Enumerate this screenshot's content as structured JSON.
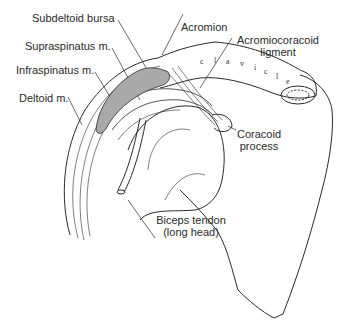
{
  "figure": {
    "labels": {
      "subdeltoid_bursa": "Subdeltoid bursa",
      "supraspinatus": "Supraspinatus m.",
      "infraspinatus": "Infraspinatus m.",
      "deltoid": "Deltoid m.",
      "acromion": "Acromion",
      "acromiocoracoid_line1": "Acromiocoracoid",
      "acromiocoracoid_line2": "ligment",
      "coracoid_line1": "Coracoid",
      "coracoid_line2": "process",
      "biceps_line1": "Biceps tendon",
      "biceps_line2": "(long head)",
      "clavicle_letters": [
        "c",
        "l",
        "a",
        "v",
        "i",
        "c",
        "l",
        "e"
      ]
    },
    "colors": {
      "ink": "#2a2a2a",
      "bursa_fill": "#a9a9a9",
      "background": "#ffffff"
    }
  }
}
